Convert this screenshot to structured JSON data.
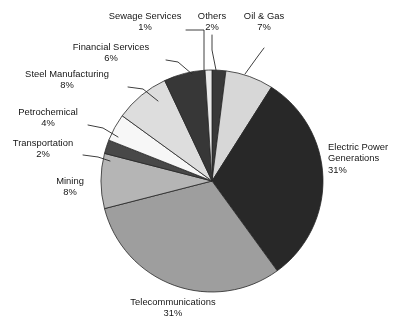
{
  "chart_data": {
    "type": "pie",
    "title": "",
    "xlabel": "",
    "ylabel": "",
    "legend_position": "none",
    "grid": false,
    "categories": [
      "Others",
      "Oil & Gas",
      "Electric Power Generations",
      "Telecommunications",
      "Mining",
      "Transportation",
      "Petrochemical",
      "Steel Manufacturing",
      "Financial Services",
      "Sewage Services"
    ],
    "values": [
      2,
      7,
      31,
      31,
      8,
      2,
      4,
      8,
      6,
      1
    ],
    "value_labels": [
      "2%",
      "7%",
      "31%",
      "31%",
      "8%",
      "2%",
      "4%",
      "8%",
      "6%",
      "1%"
    ],
    "units": "percent",
    "start_angle_deg": 0,
    "direction": "clockwise",
    "slice_colors": [
      "#3c3c3c",
      "#d4d4d4",
      "#2b2b2b",
      "#9d9d9d",
      "#b3b3b3",
      "#4a4a4a",
      "#f2f2f2",
      "#d9d9d9",
      "#3a3a3a",
      "#e6e6e6"
    ],
    "slices": [
      {
        "label": "Others",
        "value": 2,
        "pct_text": "2%",
        "color": "#3c3c3c"
      },
      {
        "label": "Oil & Gas",
        "value": 7,
        "pct_text": "7%",
        "color": "#d4d4d4"
      },
      {
        "label": "Electric Power Generations",
        "value": 31,
        "pct_text": "31%",
        "color": "#2b2b2b"
      },
      {
        "label": "Telecommunications",
        "value": 31,
        "pct_text": "31%",
        "color": "#9d9d9d"
      },
      {
        "label": "Mining",
        "value": 8,
        "pct_text": "8%",
        "color": "#b3b3b3"
      },
      {
        "label": "Transportation",
        "value": 2,
        "pct_text": "2%",
        "color": "#4a4a4a"
      },
      {
        "label": "Petrochemical",
        "value": 4,
        "pct_text": "4%",
        "color": "#f2f2f2"
      },
      {
        "label": "Steel Manufacturing",
        "value": 8,
        "pct_text": "8%",
        "color": "#d9d9d9"
      },
      {
        "label": "Financial Services",
        "value": 6,
        "pct_text": "6%",
        "color": "#3a3a3a"
      },
      {
        "label": "Sewage Services",
        "value": 1,
        "pct_text": "1%",
        "color": "#e6e6e6"
      }
    ]
  },
  "labels": {
    "sewage_services": {
      "name": "Sewage Services",
      "pct": "1%"
    },
    "others": {
      "name": "Others",
      "pct": "2%"
    },
    "oil_and_gas": {
      "name": "Oil & Gas",
      "pct": "7%"
    },
    "financial_services": {
      "name": "Financial Services",
      "pct": "6%"
    },
    "steel_manufacturing": {
      "name": "Steel Manufacturing",
      "pct": "8%"
    },
    "petrochemical": {
      "name": "Petrochemical",
      "pct": "4%"
    },
    "transportation": {
      "name": "Transportation",
      "pct": "2%"
    },
    "mining": {
      "name": "Mining",
      "pct": "8%"
    },
    "telecommunications": {
      "name": "Telecommunications",
      "pct": "31%"
    },
    "electric_power": {
      "name1": "Electric Power",
      "name2": "Generations",
      "pct": "31%"
    }
  }
}
